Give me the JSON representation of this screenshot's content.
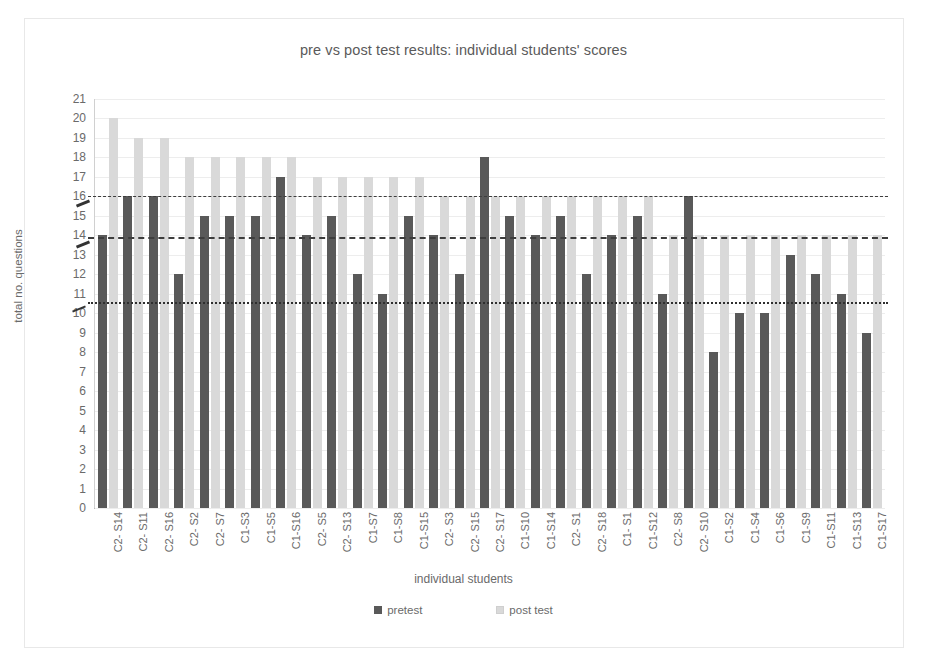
{
  "chart_data": {
    "type": "bar",
    "title": "pre vs post test results: individual students' scores",
    "xlabel": "individual students",
    "ylabel": "total no. questions",
    "ylim": [
      0,
      21
    ],
    "ytick_step": 1,
    "grid": true,
    "legend_position": "bottom",
    "categories": [
      "C2- S14",
      "C2- S11",
      "C2- S16",
      "C2- S2",
      "C2- S7",
      "C1-S3",
      "C1-S5",
      "C1-S16",
      "C2- S5",
      "C2- S13",
      "C1-S7",
      "C1-S8",
      "C1-S15",
      "C2- S3",
      "C2- S15",
      "C2- S17",
      "C1-S10",
      "C1-S14",
      "C2- S1",
      "C2- S18",
      "C1- S1",
      "C1-S12",
      "C2- S8",
      "C2- S10",
      "C1-S2",
      "C1-S4",
      "C1-S6",
      "C1-S9",
      "C1-S11",
      "C1-S13",
      "C1-S17"
    ],
    "series": [
      {
        "name": "pretest",
        "color": "#595959",
        "values": [
          14,
          16,
          16,
          12,
          15,
          15,
          15,
          17,
          14,
          15,
          12,
          11,
          15,
          14,
          12,
          18,
          15,
          14,
          15,
          12,
          14,
          15,
          11,
          16,
          8,
          10,
          10,
          13,
          12,
          11,
          9
        ]
      },
      {
        "name": "post test",
        "color": "#d9d9d9",
        "values": [
          20,
          19,
          19,
          18,
          18,
          18,
          18,
          18,
          17,
          17,
          17,
          17,
          17,
          16,
          16,
          16,
          16,
          16,
          16,
          16,
          16,
          16,
          14,
          14,
          14,
          14,
          14,
          14,
          14,
          14,
          14
        ]
      }
    ],
    "reference_lines": [
      {
        "name": "post-test-mean",
        "value": 16.0,
        "style": "dash-dot"
      },
      {
        "name": "pre-test-mean-upper",
        "value": 13.9,
        "style": "dashed"
      },
      {
        "name": "pre-test-mean-lower",
        "value": 10.6,
        "style": "dotted"
      }
    ],
    "ytick_labels": [
      "21",
      "20",
      "19",
      "18",
      "17",
      "16",
      "15",
      "14",
      "13",
      "12",
      "11",
      "10",
      "9",
      "8",
      "7",
      "6",
      "5",
      "4",
      "3",
      "2",
      "1",
      "0"
    ]
  },
  "legend": {
    "items": [
      {
        "label": "pretest"
      },
      {
        "label": "post test"
      }
    ]
  }
}
